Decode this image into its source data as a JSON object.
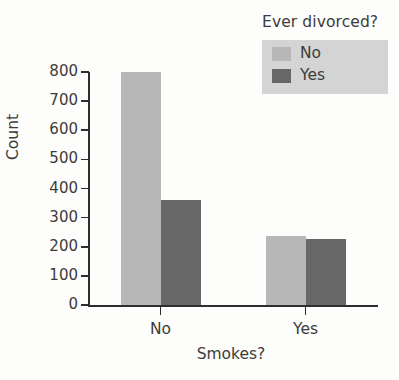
{
  "chart_data": {
    "type": "bar",
    "title": "",
    "xlabel": "Smokes?",
    "ylabel": "Count",
    "categories": [
      "No",
      "Yes"
    ],
    "series": [
      {
        "name": "No",
        "values": [
          800,
          237
        ],
        "color": "#b7b7b7"
      },
      {
        "name": "Yes",
        "values": [
          360,
          227
        ],
        "color": "#676767"
      }
    ],
    "legend": {
      "title": "Ever divorced?",
      "position": "top-right",
      "background": "#d4d4d4",
      "entries": [
        {
          "label": "No",
          "color": "#b7b7b7"
        },
        {
          "label": "Yes",
          "color": "#676767"
        }
      ]
    },
    "ylim": [
      0,
      800
    ],
    "yticks": [
      0,
      100,
      200,
      300,
      400,
      500,
      600,
      700,
      800
    ],
    "ytick_labels": [
      "0",
      "100",
      "200",
      "300",
      "400",
      "500",
      "600",
      "700",
      "800"
    ],
    "grid": false,
    "axis_color": "#2e2e2e",
    "background": "#fdfdfb"
  }
}
